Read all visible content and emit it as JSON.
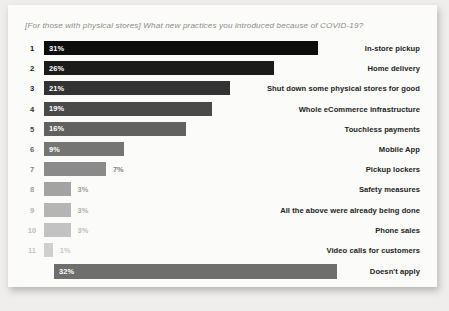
{
  "chart_data": {
    "type": "bar",
    "orientation": "horizontal",
    "title": "[For those with physical stores] What new practices you introduced because of COVID-19?",
    "xlabel": "",
    "ylabel": "",
    "xlim": [
      0,
      32
    ],
    "grid": false,
    "legend": false,
    "value_suffix": "%",
    "categories": [
      "In-store pickup",
      "Home delivery",
      "Shut down some physical stores for good",
      "Whole eCommerce infrastructure",
      "Touchless payments",
      "Mobile App",
      "Pickup lockers",
      "Safety measures",
      "All the above were already being done",
      "Phone sales",
      "Video calls for customers",
      "Doesn't apply"
    ],
    "values": [
      31,
      26,
      21,
      19,
      16,
      9,
      7,
      3,
      3,
      3,
      1,
      32
    ],
    "rows": [
      {
        "rank": "1",
        "value": 31,
        "value_label": "31%",
        "category": "In-store pickup",
        "bar_color": "#0d0d0d",
        "rank_color": "#111111",
        "label_inside": true
      },
      {
        "rank": "2",
        "value": 26,
        "value_label": "26%",
        "category": "Home delivery",
        "bar_color": "#1b1b1b",
        "rank_color": "#171717",
        "label_inside": true
      },
      {
        "rank": "3",
        "value": 21,
        "value_label": "21%",
        "category": "Shut down some physical stores for good",
        "bar_color": "#333333",
        "rank_color": "#1f1f1f",
        "label_inside": true
      },
      {
        "rank": "4",
        "value": 19,
        "value_label": "19%",
        "category": "Whole eCommerce infrastructure",
        "bar_color": "#4a4a4a",
        "rank_color": "#313131",
        "label_inside": true
      },
      {
        "rank": "5",
        "value": 16,
        "value_label": "16%",
        "category": "Touchless payments",
        "bar_color": "#616161",
        "rank_color": "#4a4a4a",
        "label_inside": true
      },
      {
        "rank": "6",
        "value": 9,
        "value_label": "9%",
        "category": "Mobile App",
        "bar_color": "#757575",
        "rank_color": "#636363",
        "label_inside": true
      },
      {
        "rank": "7",
        "value": 7,
        "value_label": "7%",
        "category": "Pickup lockers",
        "bar_color": "#8a8a8a",
        "rank_color": "#808080",
        "label_inside": false
      },
      {
        "rank": "8",
        "value": 3,
        "value_label": "3%",
        "category": "Safety measures",
        "bar_color": "#a3a3a3",
        "rank_color": "#9e9e9e",
        "label_inside": false
      },
      {
        "rank": "9",
        "value": 3,
        "value_label": "3%",
        "category": "All the above were already being done",
        "bar_color": "#b5b5b5",
        "rank_color": "#b2b2b2",
        "label_inside": false
      },
      {
        "rank": "10",
        "value": 3,
        "value_label": "3%",
        "category": "Phone sales",
        "bar_color": "#c2c2c2",
        "rank_color": "#bdbdbd",
        "label_inside": false
      },
      {
        "rank": "11",
        "value": 1,
        "value_label": "1%",
        "category": "Video calls for customers",
        "bar_color": "#cfcfcf",
        "rank_color": "#c7c7c7",
        "label_inside": false
      },
      {
        "rank": "",
        "value": 32,
        "value_label": "32%",
        "category": "Doesn't apply",
        "bar_color": "#6e6e6e",
        "rank_color": "#6e6e6e",
        "label_inside": true
      }
    ]
  }
}
